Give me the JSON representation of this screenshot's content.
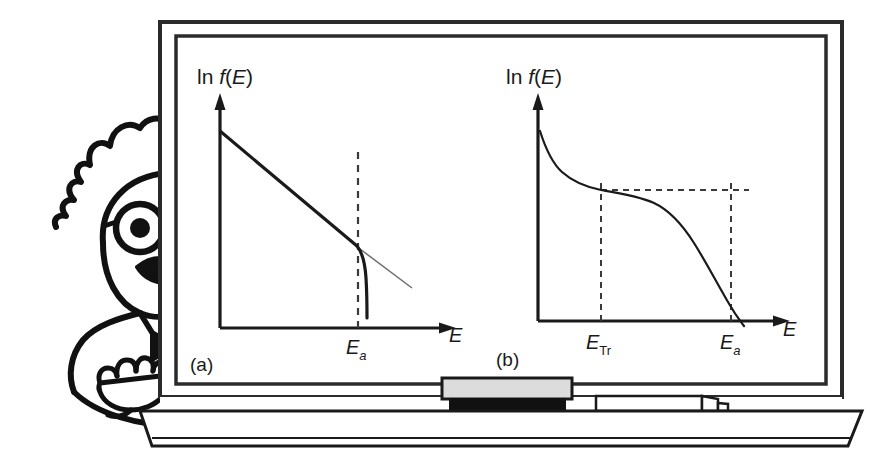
{
  "figure": {
    "medium": "blackboard-illustration",
    "character": {
      "name": "professor-cartoon",
      "features": [
        "wild-hair",
        "round-glasses",
        "mustache",
        "bow-tie",
        "pointing-hand"
      ]
    },
    "board": {
      "frame_color": "#2b2b2b",
      "surface_color": "#ffffff",
      "tray_color": "#ffffff",
      "eraser": {
        "top_color": "#dcdcdc",
        "bottom_color": "#111111",
        "name": "chalkboard-eraser"
      },
      "chalk": {
        "color": "#ffffff",
        "name": "chalk-stick"
      }
    }
  },
  "chart_data": [
    {
      "id": "panel-a",
      "type": "line",
      "panel_label": "(a)",
      "title": "",
      "ylabel_parts": {
        "prefix": "ln ",
        "func": "f",
        "open": "(",
        "var": "E",
        "close": ")"
      },
      "ylabel": "ln f(E)",
      "xlabel": "E",
      "grid": false,
      "legend": null,
      "xticks": [
        {
          "label": "E",
          "sub": "a",
          "sub_style": "italic",
          "x_frac": 0.62
        }
      ],
      "yticks": [],
      "annotations": [
        {
          "name": "vertical-dashed-Ea",
          "type": "vline",
          "x_frac": 0.62,
          "style": "dashed"
        }
      ],
      "series": [
        {
          "name": "arrhenius-line",
          "style": "solid-thick",
          "comment": "straight descending line from high intercept to the break at Ea",
          "points": [
            [
              0.0,
              0.86
            ],
            [
              0.62,
              0.31
            ]
          ]
        },
        {
          "name": "post-break-drop",
          "style": "solid-thick",
          "comment": "steep downturn just past Ea",
          "points": [
            [
              0.62,
              0.31
            ],
            [
              0.645,
              0.25
            ],
            [
              0.658,
              0.16
            ],
            [
              0.665,
              0.04
            ],
            [
              0.666,
              0.0
            ]
          ]
        },
        {
          "name": "extrapolated-line",
          "style": "solid-thin",
          "comment": "faint extrapolation of the straight line beyond Ea",
          "points": [
            [
              0.62,
              0.31
            ],
            [
              0.92,
              0.045
            ]
          ]
        }
      ],
      "xlim": [
        0,
        1
      ],
      "ylim": [
        0,
        1
      ]
    },
    {
      "id": "panel-b",
      "type": "line",
      "panel_label": "(b)",
      "title": "",
      "ylabel_parts": {
        "prefix": "ln ",
        "func": "f",
        "open": "(",
        "var": "E",
        "close": ")"
      },
      "ylabel": "ln f(E)",
      "xlabel": "E",
      "grid": false,
      "legend": null,
      "xticks": [
        {
          "label": "E",
          "sub": "Tr",
          "sub_style": "roman",
          "x_frac": 0.315
        },
        {
          "label": "E",
          "sub": "a",
          "sub_style": "italic",
          "x_frac": 0.8
        }
      ],
      "yticks": [],
      "annotations": [
        {
          "name": "vertical-dashed-ETr",
          "type": "vline",
          "x_frac": 0.315,
          "style": "dashed"
        },
        {
          "name": "vertical-dashed-Ea",
          "type": "vline",
          "x_frac": 0.8,
          "style": "dashed"
        },
        {
          "name": "horizontal-dashed-plateau",
          "type": "hline",
          "y_frac": 0.545,
          "x_from": 0.315,
          "x_to": 0.855,
          "style": "dashed"
        }
      ],
      "series": [
        {
          "name": "tunneling-plateau-curve",
          "style": "solid-thin",
          "comment": "steep initial drop, long flat plateau between ETr and near Ea, then steep fall past Ea",
          "points": [
            [
              0.01,
              0.86
            ],
            [
              0.04,
              0.76
            ],
            [
              0.09,
              0.69
            ],
            [
              0.15,
              0.635
            ],
            [
              0.22,
              0.59
            ],
            [
              0.28,
              0.562
            ],
            [
              0.315,
              0.548
            ],
            [
              0.4,
              0.535
            ],
            [
              0.5,
              0.518
            ],
            [
              0.58,
              0.495
            ],
            [
              0.64,
              0.455
            ],
            [
              0.7,
              0.39
            ],
            [
              0.745,
              0.315
            ],
            [
              0.78,
              0.23
            ],
            [
              0.8,
              0.175
            ],
            [
              0.825,
              0.105
            ],
            [
              0.845,
              0.04
            ],
            [
              0.855,
              0.0
            ]
          ]
        }
      ],
      "xlim": [
        0,
        1
      ],
      "ylim": [
        0,
        1
      ]
    }
  ]
}
